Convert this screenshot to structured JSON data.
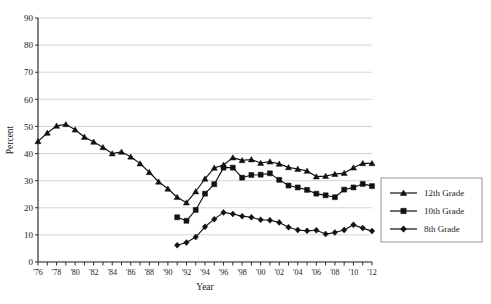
{
  "chart_data": {
    "type": "line",
    "title": "",
    "xlabel": "Year",
    "ylabel": "Percent",
    "xlim": [
      1976,
      2012
    ],
    "ylim": [
      0,
      90
    ],
    "ytick_step": 10,
    "xtick_label_step": 2,
    "grid": "horizontal",
    "legend_position": "right-outside",
    "yticks": [
      "0",
      "10",
      "20",
      "30",
      "40",
      "50",
      "60",
      "70",
      "80",
      "90"
    ],
    "xticks": [
      "'76",
      "'78",
      "'80",
      "'82",
      "'84",
      "'86",
      "'88",
      "'90",
      "'92",
      "'94",
      "'96",
      "'98",
      "'00",
      "'02",
      "'04",
      "'06",
      "'08",
      "'10",
      "'12"
    ],
    "x": [
      1976,
      1977,
      1978,
      1979,
      1980,
      1981,
      1982,
      1983,
      1984,
      1985,
      1986,
      1987,
      1988,
      1989,
      1990,
      1991,
      1992,
      1993,
      1994,
      1995,
      1996,
      1997,
      1998,
      1999,
      2000,
      2001,
      2002,
      2003,
      2004,
      2005,
      2006,
      2007,
      2008,
      2009,
      2010,
      2011,
      2012
    ],
    "series": [
      {
        "name": "12th Grade",
        "marker": "triangle",
        "color": "#111111",
        "x": [
          1976,
          1977,
          1978,
          1979,
          1980,
          1981,
          1982,
          1983,
          1984,
          1985,
          1986,
          1987,
          1988,
          1989,
          1990,
          1991,
          1992,
          1993,
          1994,
          1995,
          1996,
          1997,
          1998,
          1999,
          2000,
          2001,
          2002,
          2003,
          2004,
          2005,
          2006,
          2007,
          2008,
          2009,
          2010,
          2011,
          2012
        ],
        "values": [
          44.5,
          47.6,
          50.2,
          50.8,
          48.8,
          46.1,
          44.3,
          42.3,
          40.0,
          40.6,
          38.8,
          36.3,
          33.1,
          29.6,
          27.0,
          23.9,
          21.9,
          26.0,
          30.7,
          34.7,
          35.8,
          38.5,
          37.5,
          37.8,
          36.5,
          37.0,
          36.2,
          34.9,
          34.3,
          33.6,
          31.5,
          31.7,
          32.4,
          32.8,
          34.8,
          36.4,
          36.4
        ]
      },
      {
        "name": "10th Grade",
        "marker": "square",
        "color": "#111111",
        "x": [
          1991,
          1992,
          1993,
          1994,
          1995,
          1996,
          1997,
          1998,
          1999,
          2000,
          2001,
          2002,
          2003,
          2004,
          2005,
          2006,
          2007,
          2008,
          2009,
          2010,
          2011,
          2012
        ],
        "values": [
          16.5,
          15.2,
          19.2,
          25.2,
          28.7,
          34.8,
          34.8,
          31.1,
          32.1,
          32.2,
          32.7,
          30.3,
          28.2,
          27.5,
          26.6,
          25.2,
          24.6,
          23.9,
          26.7,
          27.5,
          28.8,
          28.0
        ]
      },
      {
        "name": "8th Grade",
        "marker": "diamond",
        "color": "#111111",
        "x": [
          1991,
          1992,
          1993,
          1994,
          1995,
          1996,
          1997,
          1998,
          1999,
          2000,
          2001,
          2002,
          2003,
          2004,
          2005,
          2006,
          2007,
          2008,
          2009,
          2010,
          2011,
          2012
        ],
        "values": [
          6.2,
          7.2,
          9.2,
          13.0,
          15.8,
          18.3,
          17.7,
          16.9,
          16.5,
          15.6,
          15.4,
          14.6,
          12.8,
          11.8,
          11.5,
          11.7,
          10.3,
          10.9,
          11.8,
          13.7,
          12.5,
          11.4
        ]
      }
    ]
  },
  "legend": {
    "entries": [
      {
        "label": "12th Grade",
        "marker": "triangle"
      },
      {
        "label": "10th Grade",
        "marker": "square"
      },
      {
        "label": "8th Grade",
        "marker": "diamond"
      }
    ]
  }
}
